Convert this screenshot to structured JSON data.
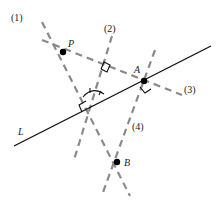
{
  "diagram": {
    "type": "geometry-construction",
    "colors": {
      "solid_line": "#111111",
      "dashed_line": "#8a8a8a",
      "point": "#000000",
      "text": "#222222"
    },
    "line_L": {
      "label": "L",
      "x1": 14,
      "y1": 146,
      "x2": 211,
      "y2": 46
    },
    "points": [
      {
        "id": "P",
        "label": "P",
        "x": 63,
        "y": 52,
        "lx": 68,
        "ly": 47
      },
      {
        "id": "A",
        "label": "A",
        "x": 144,
        "y": 81,
        "lx": 134,
        "ly": 73
      },
      {
        "id": "B",
        "label": "B",
        "x": 117,
        "y": 162,
        "lx": 124,
        "ly": 166
      }
    ],
    "dashed_lines": [
      {
        "id": "1",
        "label": "(1)",
        "x1": 42,
        "y1": 20,
        "x2": 130,
        "y2": 196,
        "lx": 11,
        "ly": 20
      },
      {
        "id": "2",
        "label": "(2)",
        "x1": 113,
        "y1": 32,
        "x2": 72,
        "y2": 160,
        "lx": 104,
        "ly": 31
      },
      {
        "id": "3",
        "label": "(3)",
        "x1": 40,
        "y1": 40,
        "x2": 180,
        "y2": 95,
        "lx": 184,
        "ly": 93
      },
      {
        "id": "4",
        "label": "(4)",
        "x1": 155,
        "y1": 50,
        "x2": 102,
        "y2": 195,
        "lx": 132,
        "ly": 130
      }
    ],
    "labels": {
      "L": "L",
      "P": "P",
      "A": "A",
      "B": "B",
      "line1": "(1)",
      "line2": "(2)",
      "line3": "(3)",
      "line4": "(4)"
    }
  }
}
